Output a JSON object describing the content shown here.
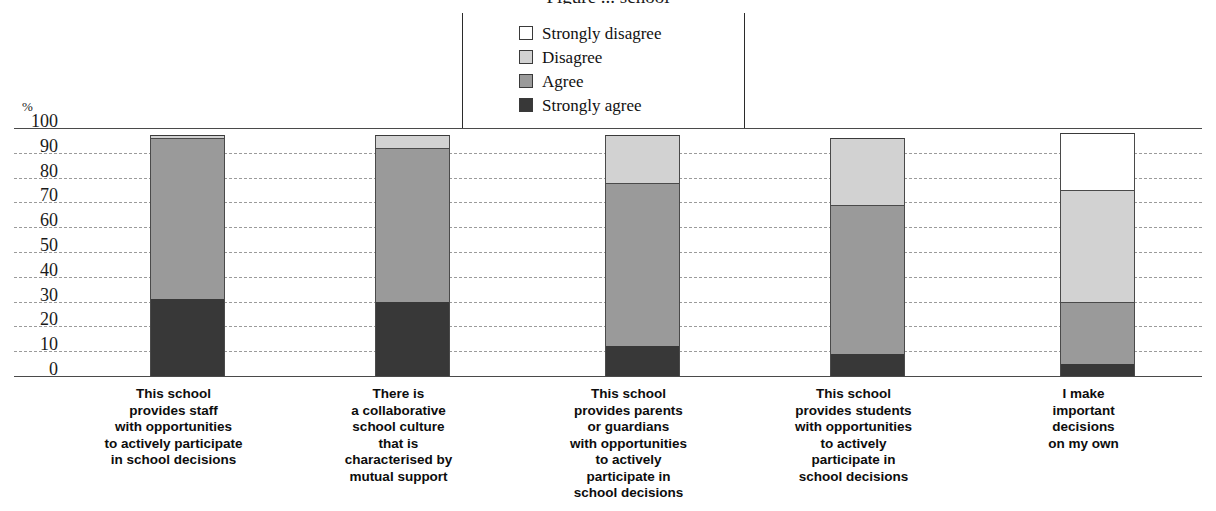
{
  "chart_data": {
    "type": "bar",
    "subtype": "stacked-bar-100",
    "title": "Figure ... school",
    "xlabel": "",
    "ylabel": "%",
    "ylim": [
      0,
      100
    ],
    "yticks": [
      "100",
      "90",
      "80",
      "70",
      "60",
      "50",
      "40",
      "30",
      "20",
      "10",
      "0"
    ],
    "grid": true,
    "legend_position": "top-center",
    "categories": [
      "This school\nprovides staff\nwith opportunities\nto actively participate\nin school decisions",
      "There is\na collaborative\nschool culture\nthat is\ncharacterised by\nmutual support",
      "This school\nprovides parents\nor guardians\nwith opportunities\nto actively\nparticipate in\nschool decisions",
      "This school\nprovides students\nwith opportunities\nto actively\nparticipate in\nschool decisions",
      "I make\nimportant\ndecisions\non my own"
    ],
    "series": [
      {
        "name": "Strongly agree",
        "color": "#383838",
        "values": [
          31,
          30,
          12,
          9,
          5
        ]
      },
      {
        "name": "Agree",
        "color": "#9a9a9a",
        "values": [
          65,
          62,
          66,
          60,
          25
        ]
      },
      {
        "name": "Disagree",
        "color": "#d2d2d2",
        "values": [
          1,
          5,
          19,
          27,
          45
        ]
      },
      {
        "name": "Strongly disagree",
        "color": "#ffffff",
        "values": [
          0,
          0,
          0,
          0,
          23
        ]
      }
    ]
  },
  "legend": {
    "items": [
      {
        "label": "Strongly disagree",
        "color": "#ffffff"
      },
      {
        "label": "Disagree",
        "color": "#d2d2d2"
      },
      {
        "label": "Agree",
        "color": "#9a9a9a"
      },
      {
        "label": "Strongly agree",
        "color": "#383838"
      }
    ]
  },
  "axis": {
    "percent_symbol": "%",
    "ticks": [
      "100",
      "90",
      "80",
      "70",
      "60",
      "50",
      "40",
      "30",
      "20",
      "10",
      "0"
    ]
  },
  "category_labels": [
    [
      "This school",
      "provides staff",
      "with opportunities",
      "to actively participate",
      "in school decisions"
    ],
    [
      "There is",
      "a collaborative",
      "school culture",
      "that is",
      "characterised by",
      "mutual support"
    ],
    [
      "This school",
      "provides parents",
      "or guardians",
      "with opportunities",
      "to actively",
      "participate in",
      "school decisions"
    ],
    [
      "This school",
      "provides students",
      "with opportunities",
      "to actively",
      "participate in",
      "school decisions"
    ],
    [
      "I make",
      "important",
      "decisions",
      "on my own"
    ]
  ]
}
